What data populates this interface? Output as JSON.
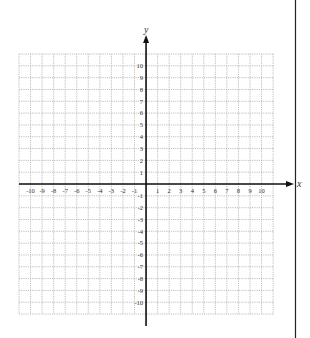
{
  "diagram": {
    "type": "coordinate-plane",
    "x_axis": {
      "label": "x",
      "min": -10,
      "max": 10,
      "tick_labels": [
        "-10",
        "-9",
        "-8",
        "-7",
        "-6",
        "-5",
        "-4",
        "-3",
        "-2",
        "-1",
        "1",
        "2",
        "3",
        "4",
        "5",
        "6",
        "7",
        "8",
        "9",
        "10"
      ]
    },
    "y_axis": {
      "label": "y",
      "min": -10,
      "max": 10,
      "tick_labels": [
        "10",
        "9",
        "8",
        "7",
        "6",
        "5",
        "4",
        "3",
        "2",
        "1",
        "-1",
        "-2",
        "-3",
        "-4",
        "-5",
        "-6",
        "-7",
        "-8",
        "-9",
        "-10"
      ]
    },
    "grid": {
      "columns": 22,
      "rows": 22,
      "style": "dotted"
    },
    "colors": {
      "grid": "#b0b0b0",
      "axis": "#111111",
      "label": "#333333",
      "border_line": "#222222"
    }
  }
}
